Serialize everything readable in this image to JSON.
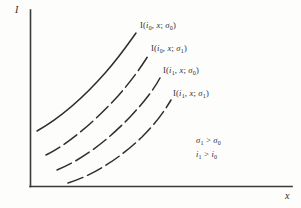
{
  "figure": {
    "type": "line-diagram",
    "background_color": "#fdfdfc",
    "ink_color": "#2e2e30"
  },
  "axes": {
    "y_label": "I",
    "x_label": "x",
    "origin": [
      30,
      186
    ],
    "x_axis_end": [
      292,
      186
    ],
    "y_axis_top": [
      30,
      10
    ],
    "ticks": "none",
    "grid": "off"
  },
  "curves": [
    {
      "id": "curve-1",
      "label": "I(i0, x; σ0)",
      "label_parts": {
        "head": "I(",
        "i_sym": "i",
        "i_sub": "0",
        "mid": ", ",
        "x_sym": "x",
        "semi": "; ",
        "s_sym": "σ",
        "s_sub": "0",
        "tail": ")"
      },
      "style": "solid",
      "path": "M 37,131 C 60,118 85,96 106,72 C 120,56 128,44 136,33"
    },
    {
      "id": "curve-2",
      "label": "I(i0, x; σ1)",
      "label_parts": {
        "head": "I(",
        "i_sym": "i",
        "i_sub": "0",
        "mid": ", ",
        "x_sym": "x",
        "semi": "; ",
        "s_sym": "σ",
        "s_sub": "1",
        "tail": ")"
      },
      "style": "dashed",
      "path": "M 46,155 C 70,143 96,120 118,96 C 132,80 141,67 148,56"
    },
    {
      "id": "curve-3",
      "label": "I(i1, x; σ0)",
      "label_parts": {
        "head": "I(",
        "i_sym": "i",
        "i_sub": "1",
        "mid": ", ",
        "x_sym": "x",
        "semi": "; ",
        "s_sym": "σ",
        "s_sub": "0",
        "tail": ")"
      },
      "style": "dashed",
      "path": "M 57,170 C 82,160 108,140 130,117 C 145,101 154,89 160,78"
    },
    {
      "id": "curve-4",
      "label": "I(i1, x; σ1)",
      "label_parts": {
        "head": "I(",
        "i_sym": "i",
        "i_sub": "1",
        "mid": ", ",
        "x_sym": "x",
        "semi": "; ",
        "s_sym": "σ",
        "s_sub": "1",
        "tail": ")"
      },
      "style": "dashed",
      "path": "M 68,183 C 94,175 120,158 142,137 C 157,122 165,110 171,100"
    }
  ],
  "annotations": [
    {
      "id": "annotation-sigma",
      "text": "σ1 > σ0",
      "parts": {
        "lhs_sym": "σ",
        "lhs_sub": "1",
        "rel": " > ",
        "rhs_sym": "σ",
        "rhs_sub": "0"
      }
    },
    {
      "id": "annotation-intensity",
      "text": "i1 > i0",
      "parts": {
        "lhs_sym": "i",
        "lhs_sub": "1",
        "rel": " > ",
        "rhs_sym": "i",
        "rhs_sub": "0"
      }
    }
  ]
}
